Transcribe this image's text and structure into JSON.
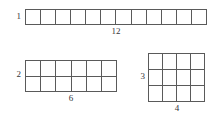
{
  "diagram": {
    "stroke_color": "#5a5a5a",
    "text_color": "#35353a",
    "background_color": "#ffffff",
    "figures": [
      {
        "id": "figure-1",
        "rows": 1,
        "cols": 12,
        "height_label": "1",
        "width_label": "12",
        "cell_count": 12
      },
      {
        "id": "figure-2",
        "rows": 2,
        "cols": 6,
        "height_label": "2",
        "width_label": "6",
        "cell_count": 12
      },
      {
        "id": "figure-3",
        "rows": 3,
        "cols": 4,
        "height_label": "3",
        "width_label": "4",
        "cell_count": 12
      }
    ]
  }
}
